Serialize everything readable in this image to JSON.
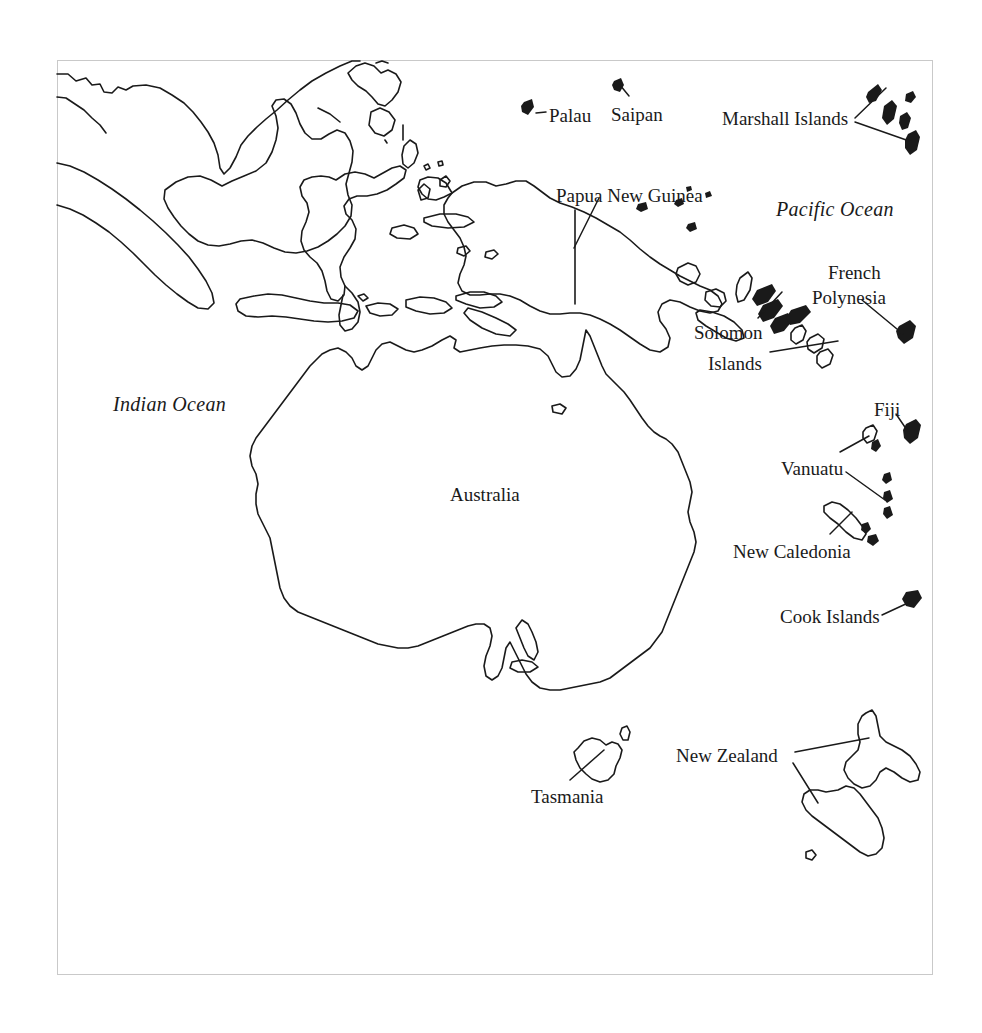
{
  "map": {
    "title": "Oceania and Southeast Asia outline map",
    "style": {
      "background_color": "#ffffff",
      "coastline_color": "#1a1a1a",
      "border_color": "#c9c9c9",
      "label_color": "#1a1a1a"
    },
    "frame": {
      "x": 57,
      "y": 60,
      "width": 876,
      "height": 915
    }
  },
  "ocean_labels": [
    {
      "name": "pacific-ocean",
      "text": "Pacific Ocean",
      "x": 776,
      "y": 198,
      "style": "italic"
    },
    {
      "name": "indian-ocean",
      "text": "Indian Ocean",
      "x": 113,
      "y": 393,
      "style": "italic"
    }
  ],
  "place_labels": [
    {
      "name": "palau",
      "text": "Palau",
      "x": 549,
      "y": 105
    },
    {
      "name": "saipan",
      "text": "Saipan",
      "x": 611,
      "y": 104
    },
    {
      "name": "marshall-islands",
      "text": "Marshall Islands",
      "x": 722,
      "y": 108
    },
    {
      "name": "papua-new-guinea",
      "text": "Papua New Guinea",
      "x": 556,
      "y": 185
    },
    {
      "name": "french-polynesia-line1",
      "text": "French",
      "x": 828,
      "y": 262
    },
    {
      "name": "french-polynesia-line2",
      "text": "Polynesia",
      "x": 812,
      "y": 287
    },
    {
      "name": "solomon-line1",
      "text": "Solomon",
      "x": 694,
      "y": 322
    },
    {
      "name": "solomon-line2",
      "text": "Islands",
      "x": 708,
      "y": 353
    },
    {
      "name": "fiji",
      "text": "Fiji",
      "x": 874,
      "y": 399
    },
    {
      "name": "vanuatu",
      "text": "Vanuatu",
      "x": 781,
      "y": 458
    },
    {
      "name": "new-caledonia",
      "text": "New Caledonia",
      "x": 733,
      "y": 541
    },
    {
      "name": "cook-islands",
      "text": "Cook Islands",
      "x": 780,
      "y": 606
    },
    {
      "name": "australia",
      "text": "Australia",
      "x": 450,
      "y": 484
    },
    {
      "name": "tasmania",
      "text": "Tasmania",
      "x": 531,
      "y": 786
    },
    {
      "name": "new-zealand",
      "text": "New Zealand",
      "x": 676,
      "y": 745
    }
  ],
  "leader_lines": [
    {
      "name": "leader-palau",
      "x1": 536,
      "y1": 113,
      "x2": 546,
      "y2": 112
    },
    {
      "name": "leader-saipan",
      "x1": 629,
      "y1": 96,
      "x2": 620,
      "y2": 85
    },
    {
      "name": "leader-marshall-upper",
      "x1": 855,
      "y1": 118,
      "x2": 886,
      "y2": 88
    },
    {
      "name": "leader-marshall-lower",
      "x1": 855,
      "y1": 122,
      "x2": 912,
      "y2": 140
    },
    {
      "name": "leader-png",
      "x1": 597,
      "y1": 197,
      "x2": 575,
      "y2": 245
    },
    {
      "name": "leader-french-polynesia",
      "x1": 864,
      "y1": 300,
      "x2": 903,
      "y2": 333
    },
    {
      "name": "leader-solomon-upper",
      "x1": 760,
      "y1": 318,
      "x2": 780,
      "y2": 293
    },
    {
      "name": "leader-solomon-lower",
      "x1": 770,
      "y1": 351,
      "x2": 836,
      "y2": 340
    },
    {
      "name": "leader-fiji",
      "x1": 896,
      "y1": 414,
      "x2": 909,
      "y2": 433
    },
    {
      "name": "leader-vanuatu-upper",
      "x1": 840,
      "y1": 452,
      "x2": 868,
      "y2": 437
    },
    {
      "name": "leader-vanuatu-lower",
      "x1": 847,
      "y1": 472,
      "x2": 884,
      "y2": 499
    },
    {
      "name": "leader-new-caledonia",
      "x1": 832,
      "y1": 533,
      "x2": 851,
      "y2": 512
    },
    {
      "name": "leader-cook-islands",
      "x1": 884,
      "y1": 614,
      "x2": 911,
      "y2": 602
    },
    {
      "name": "leader-tasmania",
      "x1": 572,
      "y1": 779,
      "x2": 602,
      "y2": 752
    },
    {
      "name": "leader-nz-north",
      "x1": 797,
      "y1": 752,
      "x2": 867,
      "y2": 739
    },
    {
      "name": "leader-nz-south",
      "x1": 795,
      "y1": 764,
      "x2": 817,
      "y2": 802
    }
  ],
  "landmasses": [
    {
      "name": "australia",
      "type": "outline"
    },
    {
      "name": "new-guinea",
      "type": "outline"
    },
    {
      "name": "borneo",
      "type": "outline"
    },
    {
      "name": "sulawesi",
      "type": "outline"
    },
    {
      "name": "java",
      "type": "outline"
    },
    {
      "name": "sumatra",
      "type": "outline"
    },
    {
      "name": "new-zealand-north-island",
      "type": "outline"
    },
    {
      "name": "new-zealand-south-island",
      "type": "outline"
    },
    {
      "name": "tasmania",
      "type": "outline"
    },
    {
      "name": "new-caledonia",
      "type": "outline"
    },
    {
      "name": "solomon-islands",
      "type": "outline-chain"
    },
    {
      "name": "vanuatu",
      "type": "filled-chain"
    },
    {
      "name": "fiji",
      "type": "filled"
    },
    {
      "name": "marshall-islands",
      "type": "filled-chain"
    },
    {
      "name": "palau",
      "type": "filled"
    },
    {
      "name": "saipan",
      "type": "filled"
    },
    {
      "name": "french-polynesia",
      "type": "filled"
    },
    {
      "name": "cook-islands",
      "type": "filled"
    }
  ]
}
